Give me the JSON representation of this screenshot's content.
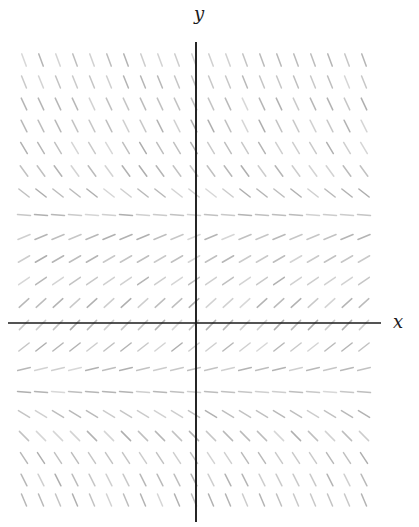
{
  "figure": {
    "background": "#ffffff",
    "width": 419,
    "height": 527
  },
  "chart_data": {
    "type": "slope_field",
    "title": "",
    "xlabel": "x",
    "ylabel": "y",
    "grid": {
      "n_cols": 21,
      "col_start_px": 24,
      "col_spacing_px": 17,
      "segment_length_px": 13,
      "segment_color": "#a9a9a9",
      "segment_stroke_width": 1.5
    },
    "rows": [
      {
        "y_px": 60,
        "angle_deg": -70
      },
      {
        "y_px": 82,
        "angle_deg": -68
      },
      {
        "y_px": 104,
        "angle_deg": -65
      },
      {
        "y_px": 126,
        "angle_deg": -63
      },
      {
        "y_px": 148,
        "angle_deg": -59
      },
      {
        "y_px": 171,
        "angle_deg": -54
      },
      {
        "y_px": 193,
        "angle_deg": -38
      },
      {
        "y_px": 215,
        "angle_deg": -4
      },
      {
        "y_px": 237,
        "angle_deg": 22
      },
      {
        "y_px": 259,
        "angle_deg": 30
      },
      {
        "y_px": 281,
        "angle_deg": 35
      },
      {
        "y_px": 303,
        "angle_deg": 42
      },
      {
        "y_px": 325,
        "angle_deg": 45
      },
      {
        "y_px": 347,
        "angle_deg": 38
      },
      {
        "y_px": 369,
        "angle_deg": 14
      },
      {
        "y_px": 392,
        "angle_deg": -5
      },
      {
        "y_px": 414,
        "angle_deg": -31
      },
      {
        "y_px": 436,
        "angle_deg": -45
      },
      {
        "y_px": 458,
        "angle_deg": -57
      },
      {
        "y_px": 480,
        "angle_deg": -63
      },
      {
        "y_px": 500,
        "angle_deg": -67
      }
    ],
    "axes": {
      "color": "#1b1b1b",
      "x_axis": {
        "y_px": 323,
        "x1_px": 8,
        "x2_px": 381,
        "stroke_width": 1.7
      },
      "y_axis": {
        "x_px": 196,
        "y1_px": 42,
        "y2_px": 522,
        "stroke_width": 1.9
      },
      "x_label_pos": {
        "x_px": 398,
        "y_px": 322
      },
      "y_label_pos": {
        "x_px": 199,
        "y_px": 14
      }
    },
    "legend": null,
    "gridlines": false
  }
}
